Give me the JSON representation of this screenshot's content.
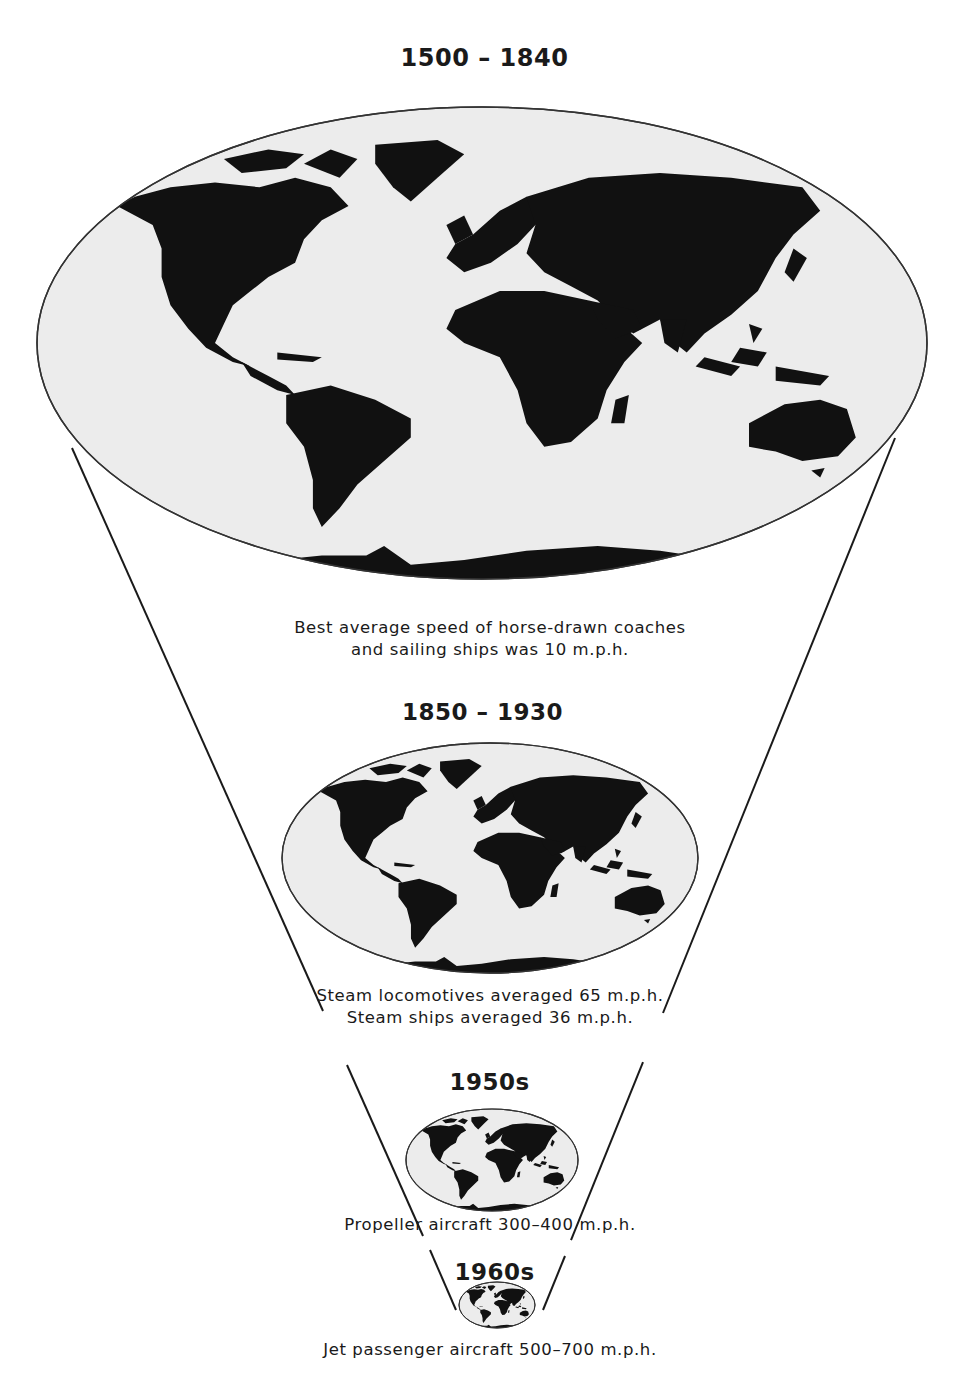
{
  "figure": {
    "colors": {
      "land": "#111111",
      "ocean": "#ececec",
      "outline": "#333333",
      "background": "#ffffff"
    },
    "eras": [
      {
        "period": "1500 – 1840",
        "caption_lines": [
          "Best average speed of horse-drawn coaches",
          "and sailing ships was 10 m.p.h."
        ],
        "speed_mph": "10"
      },
      {
        "period": "1850 – 1930",
        "caption_lines": [
          "Steam locomotives averaged 65 m.p.h.",
          "Steam ships averaged 36 m.p.h."
        ],
        "speed_mph": "65 / 36"
      },
      {
        "period": "1950s",
        "caption_lines": [
          "Propeller aircraft 300–400 m.p.h."
        ],
        "speed_mph": "300–400"
      },
      {
        "period": "1960s",
        "caption_lines": [
          "Jet passenger aircraft 500–700 m.p.h."
        ],
        "speed_mph": "500–700"
      }
    ]
  }
}
